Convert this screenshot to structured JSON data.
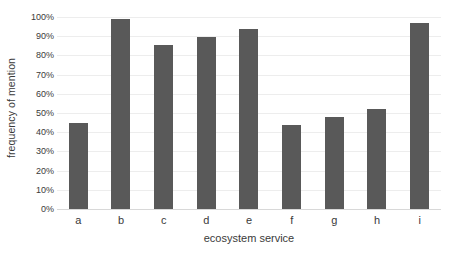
{
  "chart_data": {
    "type": "bar",
    "title": "",
    "xlabel": "ecosystem service",
    "ylabel": "frequency of mention",
    "categories": [
      "a",
      "b",
      "c",
      "d",
      "e",
      "f",
      "g",
      "h",
      "i"
    ],
    "values": [
      45,
      99,
      85.5,
      89.5,
      94,
      43.5,
      48,
      52,
      97
    ],
    "value_unit": "%",
    "ylim": [
      0,
      100
    ],
    "ytick_values": [
      0,
      10,
      20,
      30,
      40,
      50,
      60,
      70,
      80,
      90,
      100
    ],
    "ytick_labels": [
      "0%",
      "10%",
      "20%",
      "30%",
      "40%",
      "50%",
      "60%",
      "70%",
      "80%",
      "90%",
      "100%"
    ],
    "grid": true,
    "grid_axis": "y",
    "legend": false,
    "legend_position": "none",
    "bar_color": "#595959",
    "gridline_color": "#ededed",
    "background_color": "#ffffff",
    "text_color": "#3a3a3a",
    "series": [
      {
        "name": "frequency of mention",
        "values": [
          45,
          99,
          85.5,
          89.5,
          94,
          43.5,
          48,
          52,
          97
        ]
      }
    ]
  }
}
